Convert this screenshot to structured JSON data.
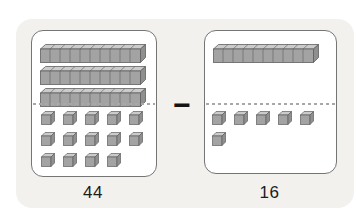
{
  "figure": {
    "operator": "−",
    "cards": [
      {
        "id": "minuend",
        "label": "44",
        "tens": 3,
        "ones": 14,
        "ones_per_row": 5
      },
      {
        "id": "subtrahend",
        "label": "16",
        "tens": 1,
        "ones": 6,
        "ones_per_row": 5
      }
    ]
  },
  "colors": {
    "panel_bg": "#f2f1ee",
    "card_bg": "#ffffff",
    "card_border": "#757575",
    "divider": "#a8a8a8",
    "block_top": "#cbcbcb",
    "block_front": "#a3a3a3",
    "block_side": "#8f8f8f",
    "block_outline": "#5f5f5f",
    "text": "#1c1c1c",
    "operator_color": "#141414"
  }
}
